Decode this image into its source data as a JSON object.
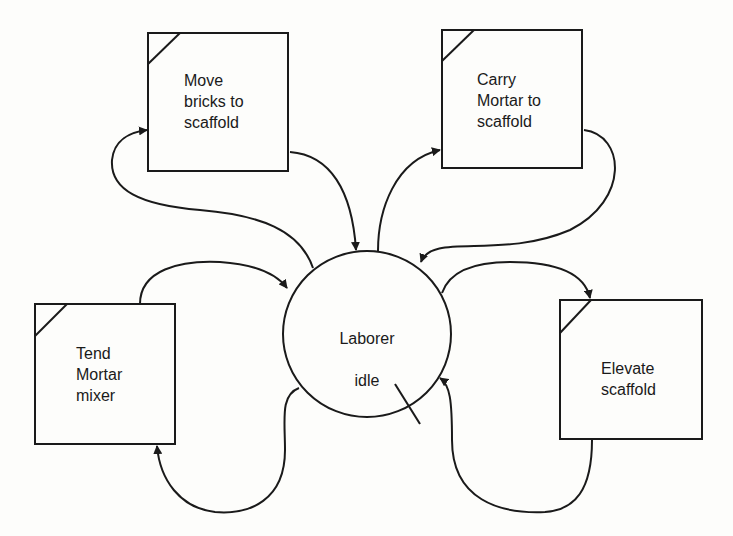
{
  "diagram": {
    "type": "activity-cycle-diagram",
    "colors": {
      "stroke": "#1a1a1a",
      "background": "#fdfdfb"
    },
    "center_node": {
      "id": "laborer-idle",
      "shape": "circle",
      "label_lines": [
        "Laborer",
        "idle"
      ]
    },
    "activity_nodes": [
      {
        "id": "move-bricks",
        "shape": "square",
        "label": "Move\nbricks to\nscaffold"
      },
      {
        "id": "carry-mortar",
        "shape": "square",
        "label": "Carry\nMortar to\nscaffold"
      },
      {
        "id": "tend-mortar-mixer",
        "shape": "square",
        "label": "Tend\nMortar\nmixer"
      },
      {
        "id": "elevate-scaffold",
        "shape": "square",
        "label": "Elevate\nscaffold"
      }
    ],
    "edges": [
      {
        "from": "laborer-idle",
        "to": "move-bricks"
      },
      {
        "from": "move-bricks",
        "to": "laborer-idle"
      },
      {
        "from": "laborer-idle",
        "to": "carry-mortar"
      },
      {
        "from": "carry-mortar",
        "to": "laborer-idle"
      },
      {
        "from": "tend-mortar-mixer",
        "to": "laborer-idle"
      },
      {
        "from": "laborer-idle",
        "to": "tend-mortar-mixer"
      },
      {
        "from": "laborer-idle",
        "to": "elevate-scaffold"
      },
      {
        "from": "elevate-scaffold",
        "to": "laborer-idle"
      }
    ]
  }
}
